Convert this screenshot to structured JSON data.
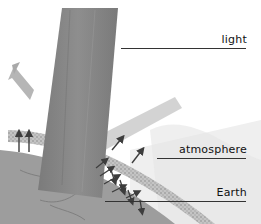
{
  "figure": {
    "labels": [
      {
        "id": "light",
        "text": "light"
      },
      {
        "id": "atmosphere",
        "text": "atmosphere"
      },
      {
        "id": "earth",
        "text": "Earth"
      }
    ]
  },
  "colors": {
    "beam": "#8a8a8a",
    "beam_dark": "#6f6f6f",
    "atmosphere": "#b9b9b9",
    "earth": "#9c9c9c",
    "arrow": "#3d3d3d",
    "leader_line": "#333333",
    "background": "#ffffff"
  }
}
